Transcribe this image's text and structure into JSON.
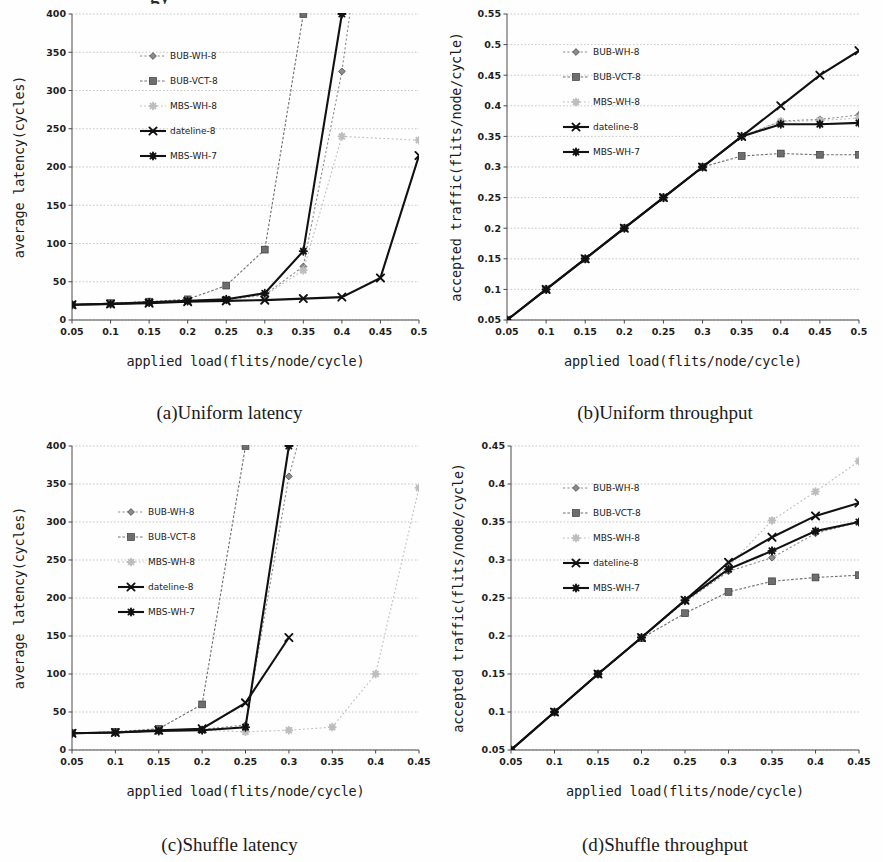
{
  "figure": {
    "cropped_header_fragment": "gy",
    "panels": [
      "a",
      "b",
      "c",
      "d"
    ]
  },
  "captions": {
    "a": "(a)Uniform latency",
    "b": "(b)Uniform throughput",
    "c": "(c)Shuffle latency",
    "d": "(d)Shuffle throughput"
  },
  "series_names": [
    "BUB-WH-8",
    "BUB-VCT-8",
    "MBS-WH-8",
    "dateline-8",
    "MBS-WH-7"
  ],
  "series_colors": [
    "#8c8c8c",
    "#6e6e6e",
    "#bdbdbd",
    "#111111",
    "#111111"
  ],
  "chart_data": [
    {
      "id": "a",
      "type": "line",
      "title": "(a)Uniform latency",
      "xlabel": "applied load(flits/node/cycle)",
      "ylabel": "average latency(cycles)",
      "x": [
        0.05,
        0.1,
        0.15,
        0.2,
        0.25,
        0.3,
        0.35,
        0.4,
        0.45,
        0.5
      ],
      "xticklabels": [
        "0.05",
        "0.1",
        "0.15",
        "0.2",
        "0.25",
        "0.3",
        "0.35",
        "0.4",
        "0.45",
        "0.5"
      ],
      "yticklabels": [
        "0",
        "50",
        "100",
        "150",
        "200",
        "250",
        "300",
        "350",
        "400"
      ],
      "xlim": [
        0.05,
        0.5
      ],
      "ylim": [
        0,
        400
      ],
      "grid": true,
      "legend_position": "upper-left",
      "series": [
        {
          "name": "BUB-WH-8",
          "values": [
            20,
            21,
            23,
            25,
            27,
            33,
            70,
            325,
            null,
            null
          ]
        },
        {
          "name": "BUB-VCT-8",
          "values": [
            20,
            22,
            24,
            27,
            45,
            92,
            400,
            null,
            null,
            null
          ]
        },
        {
          "name": "MBS-WH-8",
          "values": [
            20,
            21,
            23,
            25,
            26,
            32,
            65,
            240,
            null,
            235
          ]
        },
        {
          "name": "dateline-8",
          "values": [
            20,
            21,
            22,
            24,
            25,
            26,
            28,
            30,
            55,
            215
          ]
        },
        {
          "name": "MBS-WH-7",
          "values": [
            20,
            21,
            23,
            25,
            27,
            35,
            90,
            400,
            null,
            null
          ]
        }
      ]
    },
    {
      "id": "b",
      "type": "line",
      "title": "(b)Uniform throughput",
      "xlabel": "applied load(flits/node/cycle)",
      "ylabel": "accepted traffic(flits/node/cycle)",
      "x": [
        0.05,
        0.1,
        0.15,
        0.2,
        0.25,
        0.3,
        0.35,
        0.4,
        0.45,
        0.5
      ],
      "xticklabels": [
        "0.05",
        "0.1",
        "0.15",
        "0.2",
        "0.25",
        "0.3",
        "0.35",
        "0.4",
        "0.45",
        "0.5"
      ],
      "yticklabels": [
        "0.05",
        "0.1",
        "0.15",
        "0.2",
        "0.25",
        "0.3",
        "0.35",
        "0.4",
        "0.45",
        "0.5",
        "0.55"
      ],
      "xlim": [
        0.05,
        0.5
      ],
      "ylim": [
        0.05,
        0.55
      ],
      "grid": true,
      "legend_position": "upper-left",
      "series": [
        {
          "name": "BUB-WH-8",
          "values": [
            0.05,
            0.1,
            0.15,
            0.2,
            0.25,
            0.3,
            0.35,
            0.375,
            0.378,
            0.385
          ]
        },
        {
          "name": "BUB-VCT-8",
          "values": [
            0.05,
            0.1,
            0.15,
            0.2,
            0.25,
            0.3,
            0.318,
            0.322,
            0.32,
            0.32
          ]
        },
        {
          "name": "MBS-WH-8",
          "values": [
            0.05,
            0.1,
            0.15,
            0.2,
            0.25,
            0.3,
            0.35,
            0.374,
            0.376,
            0.38
          ]
        },
        {
          "name": "dateline-8",
          "values": [
            0.05,
            0.1,
            0.15,
            0.2,
            0.25,
            0.3,
            0.35,
            0.4,
            0.45,
            0.49
          ]
        },
        {
          "name": "MBS-WH-7",
          "values": [
            0.05,
            0.1,
            0.15,
            0.2,
            0.25,
            0.3,
            0.35,
            0.37,
            0.37,
            0.372
          ]
        }
      ]
    },
    {
      "id": "c",
      "type": "line",
      "title": "(c)Shuffle latency",
      "xlabel": "applied load(flits/node/cycle)",
      "ylabel": "average latency(cycles)",
      "x": [
        0.05,
        0.1,
        0.15,
        0.2,
        0.25,
        0.3,
        0.35,
        0.4,
        0.45
      ],
      "xticklabels": [
        "0.05",
        "0.1",
        "0.15",
        "0.2",
        "0.25",
        "0.3",
        "0.35",
        "0.4",
        "0.45"
      ],
      "yticklabels": [
        "0",
        "50",
        "100",
        "150",
        "200",
        "250",
        "300",
        "350",
        "400"
      ],
      "xlim": [
        0.05,
        0.45
      ],
      "ylim": [
        0,
        400
      ],
      "grid": true,
      "legend_position": "upper-left",
      "series": [
        {
          "name": "BUB-WH-8",
          "values": [
            22,
            23,
            26,
            27,
            33,
            360,
            null,
            null,
            null
          ]
        },
        {
          "name": "BUB-VCT-8",
          "values": [
            22,
            24,
            28,
            60,
            400,
            null,
            null,
            null,
            null
          ]
        },
        {
          "name": "MBS-WH-8",
          "values": [
            22,
            23,
            25,
            26,
            24,
            26,
            30,
            100,
            345
          ]
        },
        {
          "name": "dateline-8",
          "values": [
            22,
            23,
            26,
            28,
            62,
            148,
            null,
            null,
            null
          ]
        },
        {
          "name": "MBS-WH-7",
          "values": [
            22,
            23,
            25,
            26,
            30,
            400,
            null,
            null,
            null
          ]
        }
      ]
    },
    {
      "id": "d",
      "type": "line",
      "title": "(d)Shuffle throughput",
      "xlabel": "applied load(flits/node/cycle)",
      "ylabel": "accepted traffic(flits/node/cycle)",
      "x": [
        0.05,
        0.1,
        0.15,
        0.2,
        0.25,
        0.3,
        0.35,
        0.4,
        0.45
      ],
      "xticklabels": [
        "0.05",
        "0.1",
        "0.15",
        "0.2",
        "0.25",
        "0.3",
        "0.35",
        "0.4",
        "0.45"
      ],
      "yticklabels": [
        "0.05",
        "0.1",
        "0.15",
        "0.2",
        "0.25",
        "0.3",
        "0.35",
        "0.4",
        "0.45"
      ],
      "xlim": [
        0.05,
        0.45
      ],
      "ylim": [
        0.05,
        0.45
      ],
      "grid": true,
      "legend_position": "upper-left",
      "series": [
        {
          "name": "BUB-WH-8",
          "values": [
            0.05,
            0.1,
            0.15,
            0.198,
            0.245,
            0.285,
            0.303,
            0.335,
            0.35
          ]
        },
        {
          "name": "BUB-VCT-8",
          "values": [
            0.05,
            0.1,
            0.15,
            0.197,
            0.23,
            0.258,
            0.272,
            0.277,
            0.28
          ]
        },
        {
          "name": "MBS-WH-8",
          "values": [
            0.05,
            0.1,
            0.15,
            0.198,
            0.247,
            0.292,
            0.352,
            0.39,
            0.43
          ]
        },
        {
          "name": "dateline-8",
          "values": [
            0.05,
            0.1,
            0.15,
            0.198,
            0.247,
            0.297,
            0.33,
            0.358,
            0.375
          ]
        },
        {
          "name": "MBS-WH-7",
          "values": [
            0.05,
            0.1,
            0.15,
            0.198,
            0.247,
            0.288,
            0.312,
            0.338,
            0.35
          ]
        }
      ]
    }
  ]
}
